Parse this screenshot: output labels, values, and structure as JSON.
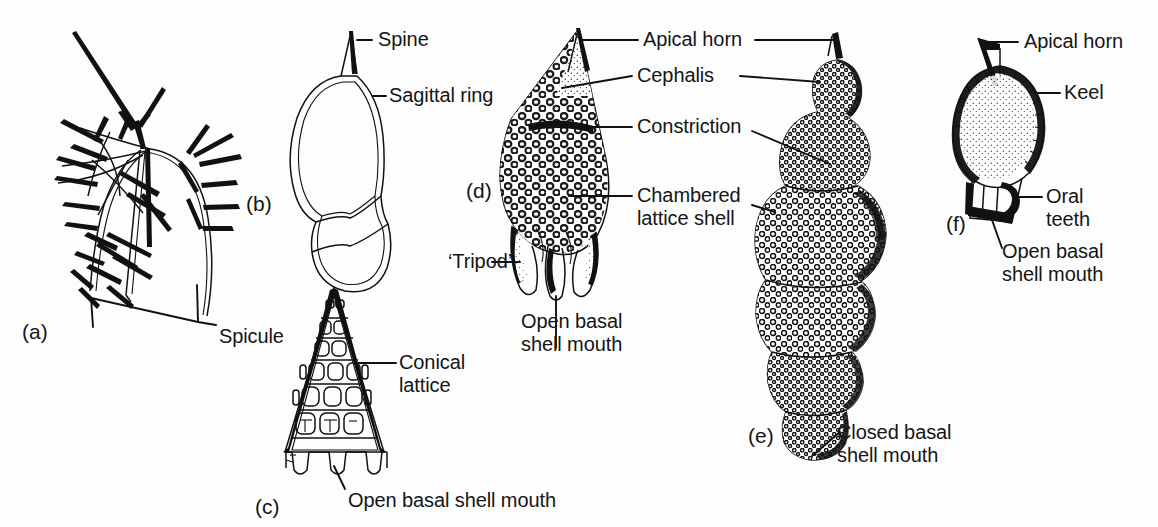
{
  "figure": {
    "background_color": "#fdfdfd",
    "ink_color": "#111111"
  },
  "panels": [
    {
      "id": "a",
      "tag": "(a)",
      "subject": "spicular skeleton with radiating spines"
    },
    {
      "id": "b",
      "tag": "(b)",
      "subject": "sagittal ring outline with apical spine"
    },
    {
      "id": "c",
      "tag": "(c)",
      "subject": "conical lattice shell with open basal mouth"
    },
    {
      "id": "d",
      "tag": "(d)",
      "subject": "chambered lattice shell with tripod feet"
    },
    {
      "id": "e",
      "tag": "(e)",
      "subject": "multi-segmented shell with closed basal mouth"
    },
    {
      "id": "f",
      "tag": "(f)",
      "subject": "keeled shell with oral teeth"
    }
  ],
  "labels": {
    "spicule": "Spicule",
    "spine": "Spine",
    "sagittal_ring": "Sagittal ring",
    "conical_lattice_line1": "Conical",
    "conical_lattice_line2": "lattice",
    "open_basal_shell_mouth_c": "Open basal shell mouth",
    "apical_horn_center": "Apical horn",
    "cephalis": "Cephalis",
    "constriction": "Constriction",
    "chambered_lattice_line1": "Chambered",
    "chambered_lattice_line2": "lattice shell",
    "tripod": "‘Tripod’",
    "open_basal_d_line1": "Open basal",
    "open_basal_d_line2": "shell mouth",
    "closed_basal_line1": "Closed basal",
    "closed_basal_line2": "shell mouth",
    "apical_horn_right": "Apical horn",
    "keel": "Keel",
    "oral_teeth_line1": "Oral",
    "oral_teeth_line2": "teeth",
    "open_basal_f_line1": "Open basal",
    "open_basal_f_line2": "shell mouth"
  },
  "panel_tags": {
    "a": "(a)",
    "b": "(b)",
    "c": "(c)",
    "d": "(d)",
    "e": "(e)",
    "f": "(f)"
  }
}
